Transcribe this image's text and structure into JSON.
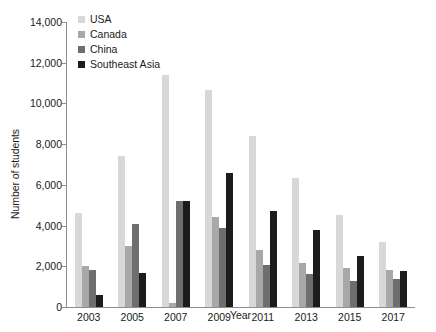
{
  "chart_data": {
    "type": "bar",
    "title": "",
    "xlabel": "Year",
    "ylabel": "Number of students",
    "categories": [
      "2003",
      "2005",
      "2007",
      "2009",
      "2011",
      "2013",
      "2015",
      "2017"
    ],
    "series": [
      {
        "name": "USA",
        "color": "#d8d8d8",
        "values": [
          4600,
          7400,
          11400,
          10650,
          8400,
          6350,
          4500,
          3200
        ]
      },
      {
        "name": "Canada",
        "color": "#a8a8a8",
        "values": [
          2000,
          3000,
          200,
          4400,
          2800,
          2150,
          1900,
          1800
        ]
      },
      {
        "name": "China",
        "color": "#6e6e6e",
        "values": [
          1800,
          4100,
          5200,
          3900,
          2050,
          1600,
          1300,
          1400
        ]
      },
      {
        "name": "Southeast Asia",
        "color": "#1c1c1c",
        "values": [
          600,
          1650,
          5200,
          6600,
          4700,
          3800,
          2500,
          1750
        ]
      }
    ],
    "ylim": [
      0,
      14000
    ],
    "ytick_values": [
      14000,
      12000,
      10000,
      8000,
      6000,
      4000,
      2000,
      0
    ],
    "ytick_labels": [
      "14,000",
      "12,000",
      "10,000",
      "8,000",
      "6,000",
      "4,000",
      "2,000",
      "0"
    ],
    "grid": false,
    "legend_position": "top-left"
  }
}
